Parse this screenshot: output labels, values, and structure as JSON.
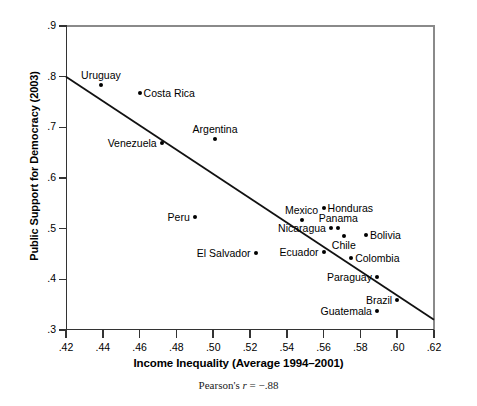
{
  "chart_data": {
    "type": "scatter",
    "title": "",
    "xlabel": "Income Inequality (Average 1994–2001)",
    "ylabel": "Public Support for Democracy (2003)",
    "annotation": "Pearson's r = −.88",
    "annotation_prefix": "Pearson's ",
    "annotation_symbol": "r",
    "annotation_value": " = −.88",
    "xlim": [
      0.42,
      0.62
    ],
    "ylim": [
      0.3,
      0.9
    ],
    "grid": false,
    "legend": "none",
    "xticks": [
      ".42",
      ".44",
      ".46",
      ".48",
      ".50",
      ".52",
      ".54",
      ".56",
      ".58",
      ".60",
      ".62"
    ],
    "xtick_values": [
      0.42,
      0.44,
      0.46,
      0.48,
      0.5,
      0.52,
      0.54,
      0.56,
      0.58,
      0.6,
      0.62
    ],
    "yticks": [
      ".9",
      ".8",
      ".7",
      ".6",
      ".5",
      ".4",
      ".3"
    ],
    "ytick_values": [
      0.9,
      0.8,
      0.7,
      0.6,
      0.5,
      0.4,
      0.3
    ],
    "trendline": {
      "x0": 0.42,
      "y0": 0.8,
      "x1": 0.62,
      "y1": 0.32
    },
    "points": [
      {
        "label": "Uruguay",
        "x": 0.439,
        "y": 0.784,
        "label_pos": "above"
      },
      {
        "label": "Costa Rica",
        "x": 0.46,
        "y": 0.768,
        "label_pos": "right"
      },
      {
        "label": "Argentina",
        "x": 0.501,
        "y": 0.677,
        "label_pos": "above"
      },
      {
        "label": "Venezuela",
        "x": 0.472,
        "y": 0.67,
        "label_pos": "left"
      },
      {
        "label": "Peru",
        "x": 0.49,
        "y": 0.523,
        "label_pos": "left"
      },
      {
        "label": "El Salvador",
        "x": 0.523,
        "y": 0.452,
        "label_pos": "left"
      },
      {
        "label": "Mexico",
        "x": 0.548,
        "y": 0.518,
        "label_pos": "above"
      },
      {
        "label": "Honduras",
        "x": 0.56,
        "y": 0.54,
        "label_pos": "right"
      },
      {
        "label": "Nicaragua",
        "x": 0.564,
        "y": 0.501,
        "label_pos": "left"
      },
      {
        "label": "Panama",
        "x": 0.568,
        "y": 0.501,
        "label_pos": "above"
      },
      {
        "label": "Chile",
        "x": 0.571,
        "y": 0.485,
        "label_pos": "below"
      },
      {
        "label": "Bolivia",
        "x": 0.583,
        "y": 0.487,
        "label_pos": "right"
      },
      {
        "label": "Ecuador",
        "x": 0.56,
        "y": 0.453,
        "label_pos": "left"
      },
      {
        "label": "Colombia",
        "x": 0.575,
        "y": 0.443,
        "label_pos": "right"
      },
      {
        "label": "Paraguay",
        "x": 0.589,
        "y": 0.404,
        "label_pos": "left"
      },
      {
        "label": "Brazil",
        "x": 0.6,
        "y": 0.36,
        "label_pos": "left"
      },
      {
        "label": "Guatemala",
        "x": 0.589,
        "y": 0.337,
        "label_pos": "left"
      }
    ]
  }
}
